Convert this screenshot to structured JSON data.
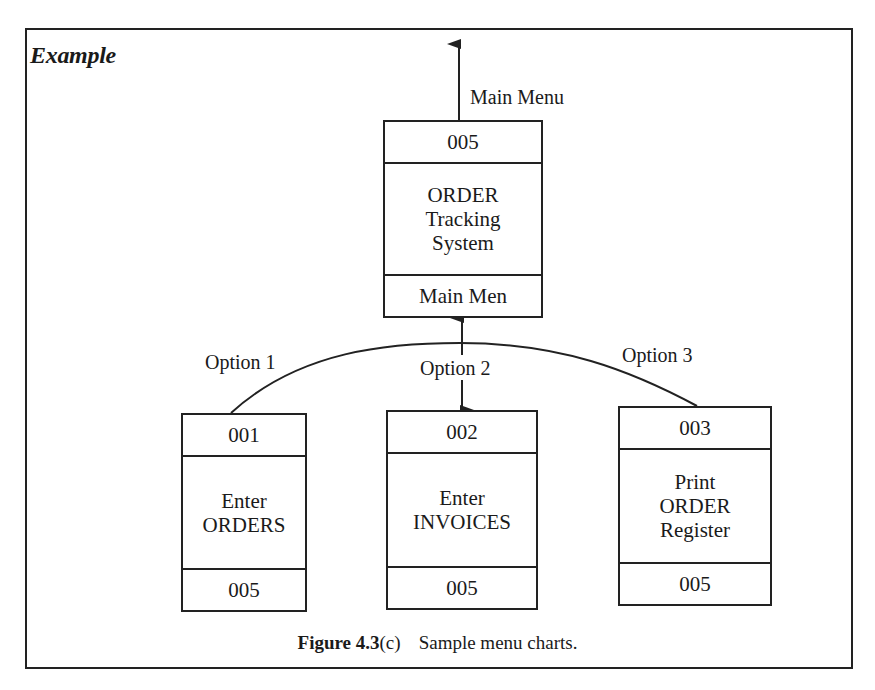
{
  "heading": "Example",
  "top_arrow_label": "Main Menu",
  "root_box": {
    "id": "005",
    "title_lines": [
      "ORDER",
      "Tracking",
      "System"
    ],
    "footer": "Main Men"
  },
  "options": [
    {
      "label": "Option 1",
      "box": {
        "id": "001",
        "title_lines": [
          "Enter",
          "ORDERS"
        ],
        "footer": "005"
      }
    },
    {
      "label": "Option 2",
      "box": {
        "id": "002",
        "title_lines": [
          "Enter",
          "INVOICES"
        ],
        "footer": "005"
      }
    },
    {
      "label": "Option 3",
      "box": {
        "id": "003",
        "title_lines": [
          "Print",
          "ORDER",
          "Register"
        ],
        "footer": "005"
      }
    }
  ],
  "caption": {
    "figure_number": "Figure 4.3",
    "figure_suffix": "(c)",
    "text": "Sample menu charts."
  },
  "colors": {
    "line": "#222222",
    "background": "#ffffff",
    "text": "#1a1a1a"
  }
}
